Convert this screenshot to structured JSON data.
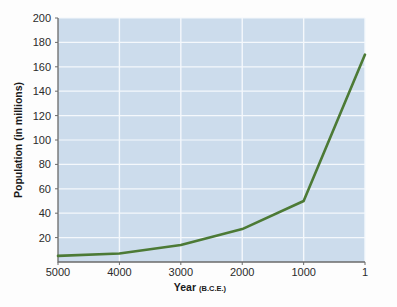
{
  "chart_data": {
    "type": "line",
    "title": "",
    "xlabel": "Year",
    "xlabel_suffix": "(B.C.E.)",
    "ylabel": "Population (in millions)",
    "x_tick_labels": [
      "5000",
      "4000",
      "3000",
      "2000",
      "1000",
      "1"
    ],
    "x_tick_values": [
      5000,
      4000,
      3000,
      2000,
      1000,
      1
    ],
    "y_tick_labels": [
      "20",
      "40",
      "60",
      "80",
      "100",
      "120",
      "140",
      "160",
      "180",
      "200"
    ],
    "y_tick_values": [
      20,
      40,
      60,
      80,
      100,
      120,
      140,
      160,
      180,
      200
    ],
    "xlim": [
      5000,
      1
    ],
    "ylim": [
      0,
      200
    ],
    "x_axis_inverted": true,
    "grid": true,
    "grid_horizontal": true,
    "grid_vertical": true,
    "legend": "none",
    "series": [
      {
        "name": "World population",
        "x": [
          5000,
          4000,
          3000,
          2000,
          1000,
          1
        ],
        "values": [
          5,
          7,
          14,
          27,
          50,
          170
        ]
      }
    ],
    "colors": {
      "line": "#4c7a35",
      "plot_background": "#ccdcec",
      "grid": "#f4f8fc",
      "axis": "#6b6b6b",
      "figure_background": "#fdfdfd",
      "text": "#1f1f1f"
    }
  }
}
